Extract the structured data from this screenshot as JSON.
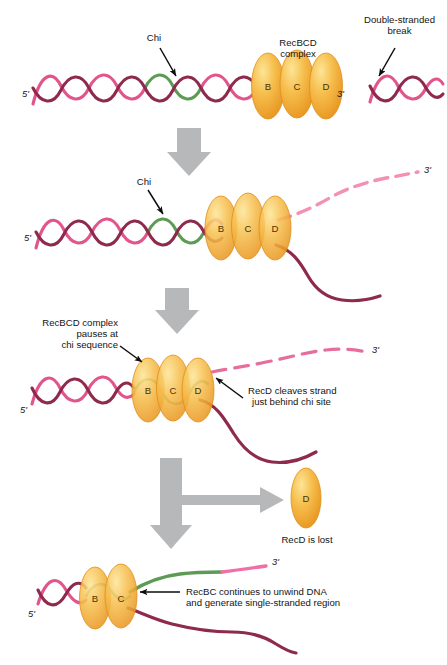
{
  "figure": {
    "type": "biology-process-diagram",
    "background": "#ffffff"
  },
  "colors": {
    "dna_pink": "#E2558C",
    "dna_pink_light": "#F48FB6",
    "dna_maroon": "#8E2A4E",
    "chi_green": "#5D9B54",
    "protein_orange": "#F0A72B",
    "protein_highlight": "#FBD87A",
    "protein_edge": "#E08A1E",
    "arrow_gray": "#B6B8BA",
    "text": "#141414"
  },
  "panels": [
    {
      "id": "panel-1",
      "name": "intact-duplex-with-recbcd",
      "labels": {
        "chi": "Chi",
        "complex": "RecBCD\ncomplex",
        "complex_line1": "RecBCD",
        "complex_line2": "complex",
        "break_line1": "Double-stranded",
        "break_line2": "break",
        "five_prime": "5'",
        "three_prime": "3'"
      },
      "subunits": [
        "B",
        "C",
        "D"
      ]
    },
    {
      "id": "panel-2",
      "name": "unwinding-begins",
      "labels": {
        "chi": "Chi",
        "five_prime": "5'",
        "three_prime": "3'"
      },
      "subunits": [
        "B",
        "C",
        "D"
      ]
    },
    {
      "id": "panel-3",
      "name": "pause-at-chi-and-cleavage",
      "labels": {
        "pause_line1": "RecBCD complex",
        "pause_line2": "pauses at",
        "pause_line3": "chi sequence",
        "cleave_line1": "RecD cleaves strand",
        "cleave_line2": "just behind chi site",
        "five_prime": "5'",
        "three_prime": "3'"
      },
      "subunits": [
        "B",
        "C",
        "D"
      ]
    },
    {
      "id": "branch",
      "name": "recd-release-branch",
      "labels": {
        "recd_lost": "RecD is lost",
        "recd_subunit": "D"
      }
    },
    {
      "id": "panel-4",
      "name": "recbc-continues-unwinding",
      "labels": {
        "continue_line1": "RecBC continues to unwind DNA",
        "continue_line2": "and generate single-stranded region",
        "five_prime": "5'",
        "three_prime": "3'"
      },
      "subunits": [
        "B",
        "C"
      ]
    }
  ],
  "arrows": {
    "step1_to_2": "down-arrow",
    "step2_to_3": "down-arrow",
    "step3_to_4": "down-and-branch-right-arrow"
  }
}
